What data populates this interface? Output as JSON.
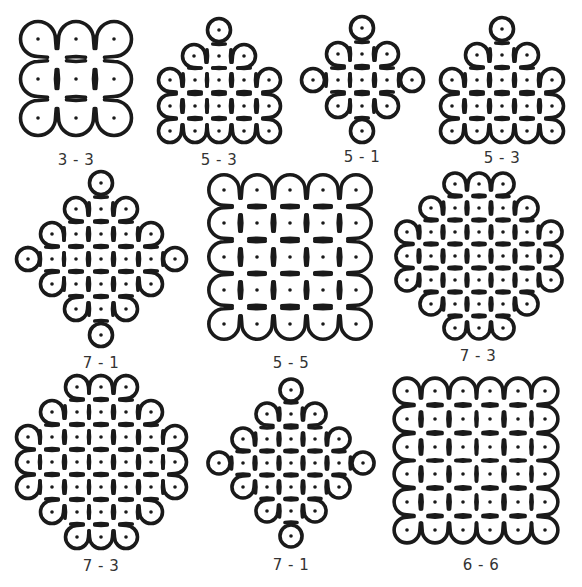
{
  "figure": {
    "stroke_color": "#1a1a1a",
    "dot_color": "#1a1a1a",
    "background": "#ffffff",
    "stroke_width": 3.6,
    "dot_radius": 1.8
  },
  "kolams": [
    {
      "label": "3 - 3",
      "label_pos": [
        76,
        160
      ],
      "spacing": 38,
      "dots": [
        [
          38,
          39
        ],
        [
          76,
          39
        ],
        [
          114,
          39
        ],
        [
          38,
          79
        ],
        [
          76,
          79
        ],
        [
          114,
          79
        ],
        [
          38,
          118
        ],
        [
          76,
          118
        ],
        [
          114,
          118
        ]
      ],
      "paths": [
        "M38,39 m0,-17 a17,17 0 1 0 12,29 L64,65 M38,39 m0,-17 a17,17 0 0 1 12,5 L64,42 a17,17 0 0 1 24,0 L102,51 a17,17 0 1 0 0,-24 L88,42 a17,17 0 0 1 -24,0 L50,27",
        "M50,51 L26,66 a17,17 0 1 0 24,0 L38,60",
        "M76,79 m-17,0 a17,17 0 1 0 34,0 a17,17 0 1 0 -34,0",
        "M114,79 m-12,-12 a17,17 0 1 1 24,24 L88,118 a17,17 0 0 1 -24,0 L50,106 a17,17 0 1 0 0,24 L64,118 a17,17 0 0 1 24,0 L102,130 a17,17 0 1 0 0,-24 L102,67"
      ]
    },
    {
      "label": "5 - 3",
      "label_pos": [
        219,
        160
      ],
      "spacing": 25,
      "dots": [
        [
          219,
          30
        ],
        [
          194,
          56
        ],
        [
          219,
          56
        ],
        [
          244,
          56
        ],
        [
          170,
          80
        ],
        [
          195,
          80
        ],
        [
          219,
          80
        ],
        [
          244,
          80
        ],
        [
          269,
          80
        ],
        [
          170,
          106
        ],
        [
          195,
          106
        ],
        [
          219,
          106
        ],
        [
          244,
          106
        ],
        [
          269,
          106
        ],
        [
          170,
          131
        ],
        [
          195,
          131
        ],
        [
          219,
          131
        ],
        [
          244,
          131
        ],
        [
          269,
          131
        ]
      ]
    },
    {
      "label": "5 - 1",
      "label_pos": [
        362,
        157
      ],
      "spacing": 25,
      "dots": [
        [
          362,
          28
        ],
        [
          338,
          54
        ],
        [
          362,
          54
        ],
        [
          387,
          54
        ],
        [
          313,
          80
        ],
        [
          338,
          80
        ],
        [
          362,
          80
        ],
        [
          387,
          80
        ],
        [
          412,
          80
        ],
        [
          338,
          106
        ],
        [
          362,
          106
        ],
        [
          387,
          106
        ],
        [
          362,
          131
        ]
      ]
    },
    {
      "label": "5 - 3",
      "label_pos": [
        502,
        158
      ],
      "spacing": 25,
      "dots": [
        [
          502,
          29
        ],
        [
          477,
          55
        ],
        [
          502,
          55
        ],
        [
          527,
          55
        ],
        [
          452,
          80
        ],
        [
          477,
          80
        ],
        [
          502,
          80
        ],
        [
          527,
          80
        ],
        [
          552,
          80
        ],
        [
          452,
          106
        ],
        [
          477,
          106
        ],
        [
          502,
          106
        ],
        [
          527,
          106
        ],
        [
          552,
          106
        ],
        [
          452,
          131
        ],
        [
          477,
          131
        ],
        [
          502,
          131
        ],
        [
          527,
          131
        ],
        [
          552,
          131
        ]
      ]
    },
    {
      "label": "7 - 1",
      "label_pos": [
        101,
        363
      ],
      "spacing": 25,
      "dots": [
        [
          101,
          183
        ],
        [
          76,
          209
        ],
        [
          101,
          209
        ],
        [
          126,
          209
        ],
        [
          52,
          234
        ],
        [
          76,
          234
        ],
        [
          101,
          234
        ],
        [
          126,
          234
        ],
        [
          151,
          234
        ],
        [
          28,
          259
        ],
        [
          52,
          259
        ],
        [
          76,
          259
        ],
        [
          101,
          259
        ],
        [
          126,
          259
        ],
        [
          151,
          259
        ],
        [
          175,
          259
        ],
        [
          52,
          284
        ],
        [
          76,
          284
        ],
        [
          101,
          284
        ],
        [
          126,
          284
        ],
        [
          151,
          284
        ],
        [
          76,
          309
        ],
        [
          101,
          309
        ],
        [
          126,
          309
        ],
        [
          101,
          335
        ]
      ]
    },
    {
      "label": "5 - 5",
      "label_pos": [
        291,
        363
      ],
      "spacing": 33,
      "dots": [
        [
          224,
          190
        ],
        [
          257,
          190
        ],
        [
          290,
          190
        ],
        [
          323,
          190
        ],
        [
          356,
          190
        ],
        [
          224,
          223
        ],
        [
          257,
          223
        ],
        [
          290,
          223
        ],
        [
          323,
          223
        ],
        [
          356,
          223
        ],
        [
          224,
          257
        ],
        [
          257,
          257
        ],
        [
          290,
          257
        ],
        [
          323,
          257
        ],
        [
          356,
          257
        ],
        [
          224,
          290
        ],
        [
          257,
          290
        ],
        [
          290,
          290
        ],
        [
          323,
          290
        ],
        [
          356,
          290
        ],
        [
          224,
          324
        ],
        [
          257,
          324
        ],
        [
          290,
          324
        ],
        [
          323,
          324
        ],
        [
          356,
          324
        ]
      ]
    },
    {
      "label": "7 - 3",
      "label_pos": [
        478,
        356
      ],
      "spacing": 24,
      "dots": [
        [
          455,
          184
        ],
        [
          479,
          184
        ],
        [
          503,
          184
        ],
        [
          431,
          208
        ],
        [
          455,
          208
        ],
        [
          479,
          208
        ],
        [
          503,
          208
        ],
        [
          527,
          208
        ],
        [
          407,
          232
        ],
        [
          431,
          232
        ],
        [
          455,
          232
        ],
        [
          479,
          232
        ],
        [
          503,
          232
        ],
        [
          527,
          232
        ],
        [
          551,
          232
        ],
        [
          407,
          256
        ],
        [
          431,
          256
        ],
        [
          455,
          256
        ],
        [
          479,
          256
        ],
        [
          503,
          256
        ],
        [
          527,
          256
        ],
        [
          551,
          256
        ],
        [
          407,
          280
        ],
        [
          431,
          280
        ],
        [
          455,
          280
        ],
        [
          479,
          280
        ],
        [
          503,
          280
        ],
        [
          527,
          280
        ],
        [
          551,
          280
        ],
        [
          431,
          304
        ],
        [
          455,
          304
        ],
        [
          479,
          304
        ],
        [
          503,
          304
        ],
        [
          527,
          304
        ],
        [
          455,
          328
        ],
        [
          479,
          328
        ],
        [
          503,
          328
        ]
      ]
    },
    {
      "label": "7 - 3",
      "label_pos": [
        101,
        566
      ],
      "spacing": 25,
      "dots": [
        [
          77,
          387
        ],
        [
          101,
          387
        ],
        [
          126,
          387
        ],
        [
          52,
          412
        ],
        [
          77,
          412
        ],
        [
          101,
          412
        ],
        [
          126,
          412
        ],
        [
          151,
          412
        ],
        [
          28,
          437
        ],
        [
          52,
          437
        ],
        [
          77,
          437
        ],
        [
          101,
          437
        ],
        [
          126,
          437
        ],
        [
          151,
          437
        ],
        [
          175,
          437
        ],
        [
          28,
          462
        ],
        [
          52,
          462
        ],
        [
          77,
          462
        ],
        [
          101,
          462
        ],
        [
          126,
          462
        ],
        [
          151,
          462
        ],
        [
          175,
          462
        ],
        [
          28,
          487
        ],
        [
          52,
          487
        ],
        [
          77,
          487
        ],
        [
          101,
          487
        ],
        [
          126,
          487
        ],
        [
          151,
          487
        ],
        [
          175,
          487
        ],
        [
          52,
          512
        ],
        [
          77,
          512
        ],
        [
          101,
          512
        ],
        [
          126,
          512
        ],
        [
          151,
          512
        ],
        [
          77,
          537
        ],
        [
          101,
          537
        ],
        [
          126,
          537
        ]
      ]
    },
    {
      "label": "7 - 1",
      "label_pos": [
        291,
        565
      ],
      "spacing": 24,
      "dots": [
        [
          291,
          390
        ],
        [
          267,
          414
        ],
        [
          291,
          414
        ],
        [
          315,
          414
        ],
        [
          243,
          439
        ],
        [
          267,
          439
        ],
        [
          291,
          439
        ],
        [
          315,
          439
        ],
        [
          339,
          439
        ],
        [
          219,
          463
        ],
        [
          243,
          463
        ],
        [
          267,
          463
        ],
        [
          291,
          463
        ],
        [
          315,
          463
        ],
        [
          339,
          463
        ],
        [
          363,
          463
        ],
        [
          243,
          487
        ],
        [
          267,
          487
        ],
        [
          291,
          487
        ],
        [
          315,
          487
        ],
        [
          339,
          487
        ],
        [
          267,
          511
        ],
        [
          291,
          511
        ],
        [
          315,
          511
        ],
        [
          291,
          536
        ]
      ]
    },
    {
      "label": "6 - 6",
      "label_pos": [
        481,
        565
      ],
      "spacing": 28,
      "dots": [
        [
          407,
          391
        ],
        [
          435,
          391
        ],
        [
          463,
          391
        ],
        [
          490,
          391
        ],
        [
          518,
          391
        ],
        [
          545,
          391
        ],
        [
          407,
          419
        ],
        [
          435,
          419
        ],
        [
          463,
          419
        ],
        [
          490,
          419
        ],
        [
          518,
          419
        ],
        [
          545,
          419
        ],
        [
          407,
          447
        ],
        [
          435,
          447
        ],
        [
          463,
          447
        ],
        [
          490,
          447
        ],
        [
          518,
          447
        ],
        [
          545,
          447
        ],
        [
          407,
          474
        ],
        [
          435,
          474
        ],
        [
          463,
          474
        ],
        [
          490,
          474
        ],
        [
          518,
          474
        ],
        [
          545,
          474
        ],
        [
          407,
          502
        ],
        [
          435,
          502
        ],
        [
          463,
          502
        ],
        [
          490,
          502
        ],
        [
          518,
          502
        ],
        [
          545,
          502
        ],
        [
          407,
          530
        ],
        [
          435,
          530
        ],
        [
          463,
          530
        ],
        [
          490,
          530
        ],
        [
          518,
          530
        ],
        [
          545,
          530
        ]
      ]
    }
  ]
}
